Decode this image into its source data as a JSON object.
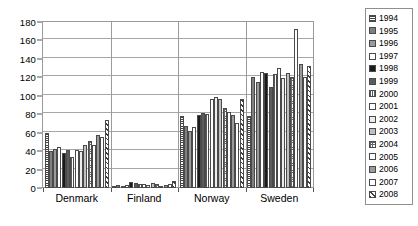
{
  "chart_data": {
    "type": "bar",
    "title": "",
    "xlabel": "",
    "ylabel": "",
    "ylim": [
      0,
      180
    ],
    "ytick_step": 20,
    "yticks": [
      0,
      20,
      40,
      60,
      80,
      100,
      120,
      140,
      160,
      180
    ],
    "grid": true,
    "legend_position": "right",
    "categories": [
      "Denmark",
      "Finland",
      "Norway",
      "Sweden"
    ],
    "series": [
      {
        "name": "1994",
        "pattern": "p-hdense",
        "values": [
          60,
          2,
          78,
          78
        ]
      },
      {
        "name": "1995",
        "pattern": "p-g55",
        "values": [
          40,
          3,
          67,
          120
        ]
      },
      {
        "name": "1996",
        "pattern": "p-g40",
        "values": [
          42,
          2,
          62,
          115
        ]
      },
      {
        "name": "1997",
        "pattern": "p-white",
        "values": [
          45,
          3,
          66,
          126
        ]
      },
      {
        "name": "1998",
        "pattern": "p-black",
        "values": [
          38,
          6,
          79,
          125
        ]
      },
      {
        "name": "1999",
        "pattern": "p-g70",
        "values": [
          41,
          5,
          81,
          110
        ]
      },
      {
        "name": "2000",
        "pattern": "p-vline",
        "values": [
          34,
          4,
          80,
          124
        ]
      },
      {
        "name": "2001",
        "pattern": "p-white",
        "values": [
          41,
          4,
          96,
          130
        ]
      },
      {
        "name": "2002",
        "pattern": "p-lgray",
        "values": [
          40,
          3,
          99,
          119
        ]
      },
      {
        "name": "2003",
        "pattern": "p-g25",
        "values": [
          47,
          5,
          97,
          125
        ]
      },
      {
        "name": "2004",
        "pattern": "p-grid",
        "values": [
          51,
          4,
          87,
          120
        ]
      },
      {
        "name": "2005",
        "pattern": "p-white",
        "values": [
          47,
          2,
          82,
          172
        ]
      },
      {
        "name": "2006",
        "pattern": "p-g40",
        "values": [
          58,
          3,
          79,
          135
        ]
      },
      {
        "name": "2007",
        "pattern": "p-white",
        "values": [
          55,
          4,
          71,
          120
        ]
      },
      {
        "name": "2008",
        "pattern": "p-diag",
        "values": [
          74,
          8,
          97,
          132
        ]
      }
    ]
  },
  "legend": {
    "items": [
      {
        "label": "1994"
      },
      {
        "label": "1995"
      },
      {
        "label": "1996"
      },
      {
        "label": "1997"
      },
      {
        "label": "1998"
      },
      {
        "label": "1999"
      },
      {
        "label": "2000"
      },
      {
        "label": "2001"
      },
      {
        "label": "2002"
      },
      {
        "label": "2003"
      },
      {
        "label": "2004"
      },
      {
        "label": "2005"
      },
      {
        "label": "2006"
      },
      {
        "label": "2007"
      },
      {
        "label": "2008"
      }
    ]
  }
}
